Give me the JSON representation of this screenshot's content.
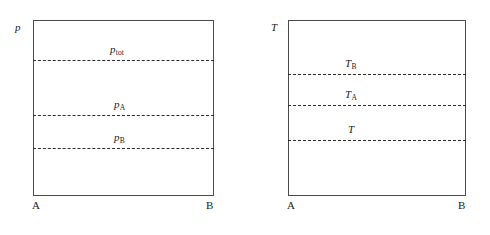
{
  "figure": {
    "background_color": "#ffffff",
    "frame_color": "#4a4a4a",
    "line_color": "#2b2b2b"
  },
  "panels": [
    {
      "id": "pressure",
      "axis_label": "p",
      "endpoints": {
        "left": "A",
        "right": "B"
      },
      "levels": [
        {
          "id": "p-tot",
          "label": "p",
          "subscript": "tot"
        },
        {
          "id": "p-a",
          "label": "p",
          "subscript": "A"
        },
        {
          "id": "p-b",
          "label": "p",
          "subscript": "B"
        }
      ]
    },
    {
      "id": "temperature",
      "axis_label": "T",
      "endpoints": {
        "left": "A",
        "right": "B"
      },
      "levels": [
        {
          "id": "t-b",
          "label": "T",
          "subscript": "B"
        },
        {
          "id": "t-a",
          "label": "T",
          "subscript": "A"
        },
        {
          "id": "t",
          "label": "T",
          "subscript": ""
        }
      ]
    }
  ],
  "chart_data": {
    "type": "line",
    "subplots": [
      {
        "name": "pressure",
        "ylabel": "p",
        "xlabel": "",
        "x_tick_labels": [
          "A",
          "B"
        ],
        "grid": false,
        "legend": "none",
        "series": [
          {
            "name": "p_tot",
            "style": "dashed",
            "constant_value": 0.77,
            "y_pixel": 60
          },
          {
            "name": "p_A",
            "style": "dashed",
            "constant_value": 0.46,
            "y_pixel": 115
          },
          {
            "name": "p_B",
            "style": "dashed",
            "constant_value": 0.27,
            "y_pixel": 148
          }
        ],
        "annotations": [
          {
            "text": "p_tot",
            "near_series": "p_tot",
            "position": "above-line-center"
          },
          {
            "text": "p_A",
            "near_series": "p_A",
            "position": "above-line-center"
          },
          {
            "text": "p_B",
            "near_series": "p_B",
            "position": "above-line-center"
          }
        ]
      },
      {
        "name": "temperature",
        "ylabel": "T",
        "xlabel": "",
        "x_tick_labels": [
          "A",
          "B"
        ],
        "grid": false,
        "legend": "none",
        "series": [
          {
            "name": "T_B",
            "style": "dashed",
            "constant_value": 0.69,
            "y_pixel": 74
          },
          {
            "name": "T_A",
            "style": "dashed",
            "constant_value": 0.52,
            "y_pixel": 105
          },
          {
            "name": "T",
            "style": "dashed",
            "constant_value": 0.32,
            "y_pixel": 140
          }
        ],
        "annotations": [
          {
            "text": "T_B",
            "near_series": "T_B",
            "position": "above-line-center"
          },
          {
            "text": "T_A",
            "near_series": "T_A",
            "position": "above-line-center"
          },
          {
            "text": "T",
            "near_series": "T",
            "position": "above-line-center"
          }
        ]
      }
    ]
  }
}
